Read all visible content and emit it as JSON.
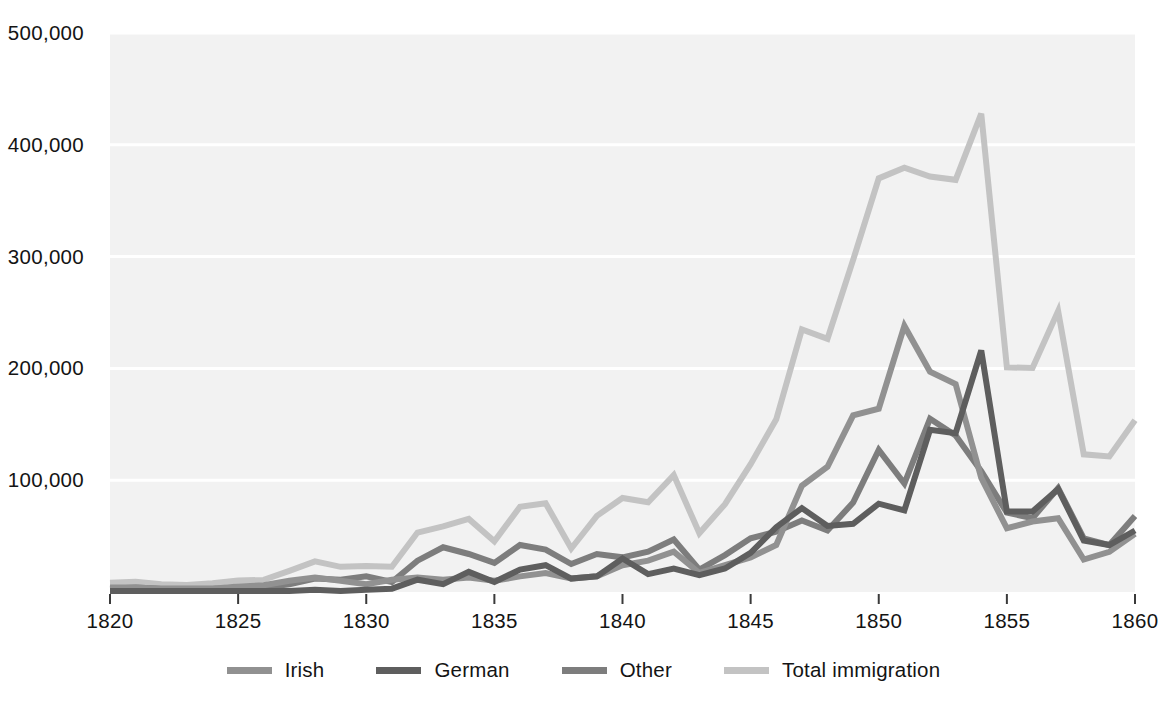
{
  "chart_data": {
    "type": "line",
    "title": "",
    "subtitle": "",
    "xlabel": "",
    "ylabel": "",
    "xlim": [
      1820,
      1860
    ],
    "ylim": [
      0,
      500000
    ],
    "grid": true,
    "gridlines_y": [
      100000,
      200000,
      300000,
      400000,
      500000
    ],
    "legend_position": "bottom",
    "x": [
      1820,
      1821,
      1822,
      1823,
      1824,
      1825,
      1826,
      1827,
      1828,
      1829,
      1830,
      1831,
      1832,
      1833,
      1834,
      1835,
      1836,
      1837,
      1838,
      1839,
      1840,
      1841,
      1842,
      1843,
      1844,
      1845,
      1846,
      1847,
      1848,
      1849,
      1850,
      1851,
      1852,
      1853,
      1854,
      1855,
      1856,
      1857,
      1858,
      1859,
      1860
    ],
    "categories": [
      1820,
      1821,
      1822,
      1823,
      1824,
      1825,
      1826,
      1827,
      1828,
      1829,
      1830,
      1831,
      1832,
      1833,
      1834,
      1835,
      1836,
      1837,
      1838,
      1839,
      1840,
      1841,
      1842,
      1843,
      1844,
      1845,
      1846,
      1847,
      1848,
      1849,
      1850,
      1851,
      1852,
      1853,
      1854,
      1855,
      1856,
      1857,
      1858,
      1859,
      1860
    ],
    "xticks": [
      1820,
      1825,
      1830,
      1835,
      1840,
      1845,
      1850,
      1855,
      1860
    ],
    "xticklabels": [
      "1820",
      "1825",
      "1830",
      "1835",
      "1840",
      "1845",
      "1850",
      "1855",
      "1860"
    ],
    "yticks": [
      100000,
      200000,
      300000,
      400000,
      500000
    ],
    "yticklabels": [
      "100,000",
      "200,000",
      "300,000",
      "400,000",
      "500,000"
    ],
    "series": [
      {
        "name": "Irish",
        "color": "#919191",
        "values": [
          4000,
          4000,
          3000,
          3000,
          3000,
          5000,
          6000,
          10000,
          13000,
          10000,
          7000,
          11000,
          13000,
          11000,
          13000,
          10000,
          14000,
          17000,
          12000,
          14000,
          24000,
          28000,
          36000,
          17000,
          24000,
          31000,
          42000,
          95000,
          112000,
          158000,
          164000,
          238000,
          197000,
          186000,
          102000,
          57000,
          63000,
          66000,
          29000,
          36000,
          52000
        ]
      },
      {
        "name": "German",
        "color": "#5e5e5e",
        "values": [
          1000,
          1000,
          1000,
          1000,
          1000,
          1000,
          1000,
          1000,
          2000,
          1000,
          2000,
          3000,
          11000,
          7000,
          18000,
          9000,
          20000,
          24000,
          12000,
          14000,
          30000,
          16000,
          21000,
          15000,
          21000,
          35000,
          58000,
          75000,
          59000,
          61000,
          79000,
          73000,
          145000,
          142000,
          216000,
          72000,
          72000,
          92000,
          46000,
          42000,
          55000
        ]
      },
      {
        "name": "Other",
        "color": "#7d7d7d",
        "values": [
          3000,
          4000,
          3000,
          3000,
          3000,
          4000,
          4000,
          7000,
          12000,
          11000,
          14000,
          9000,
          28000,
          40000,
          34000,
          26000,
          42000,
          38000,
          25000,
          34000,
          31000,
          36000,
          47000,
          20000,
          33000,
          48000,
          54000,
          64000,
          55000,
          80000,
          127000,
          97000,
          155000,
          140000,
          108000,
          71000,
          66000,
          93000,
          48000,
          42000,
          68000
        ]
      },
      {
        "name": "Total immigration",
        "color": "#c3c3c3",
        "values": [
          8385,
          9127,
          6911,
          6354,
          7912,
          10199,
          10837,
          18875,
          27382,
          22520,
          23322,
          22633,
          53179,
          58640,
          65365,
          45374,
          76242,
          79340,
          38914,
          68069,
          84066,
          80289,
          104565,
          52496,
          78615,
          114371,
          154416,
          234968,
          226527,
          297024,
          369980,
          379466,
          371603,
          368645,
          427833,
          200877,
          200436,
          251306,
          123126,
          121282,
          153640
        ]
      }
    ]
  },
  "axes": {
    "y_labels": [
      "500,000",
      "400,000",
      "300,000",
      "200,000",
      "100,000"
    ],
    "x_labels": [
      "1820",
      "1825",
      "1830",
      "1835",
      "1840",
      "1845",
      "1850",
      "1855",
      "1860"
    ]
  },
  "legend": {
    "items": [
      {
        "label": "Irish",
        "color": "#919191"
      },
      {
        "label": "German",
        "color": "#5e5e5e"
      },
      {
        "label": "Other",
        "color": "#7d7d7d"
      },
      {
        "label": "Total immigration",
        "color": "#c3c3c3"
      }
    ]
  },
  "style": {
    "plot_background": "#f2f2f2",
    "gridline_color": "#ffffff",
    "text_color": "#141414"
  }
}
